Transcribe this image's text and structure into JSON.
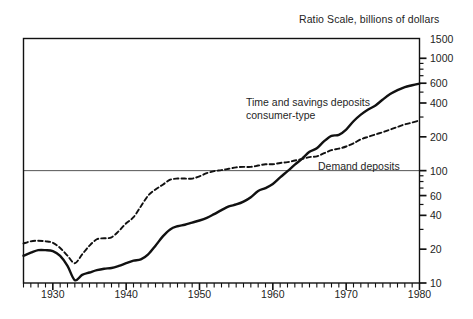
{
  "chart_data": {
    "type": "line",
    "title": "Ratio Scale, billions of dollars",
    "xlabel": "",
    "ylabel": "",
    "scale": "log",
    "grid": true,
    "gridlines_y": [
      100
    ],
    "legend_position": "inline-annotation",
    "xlim": [
      1926,
      1980
    ],
    "ylim": [
      10,
      1500
    ],
    "ytick_labels": [
      "1500",
      "1000",
      "600",
      "400",
      "200",
      "100",
      "60",
      "40",
      "20",
      "10"
    ],
    "ytick_values": [
      1500,
      1000,
      600,
      400,
      200,
      100,
      60,
      40,
      20,
      10
    ],
    "xtick_labels": [
      "1930",
      "1940",
      "1950",
      "1960",
      "1970",
      "1980"
    ],
    "xtick_values": [
      1930,
      1940,
      1950,
      1960,
      1970,
      1980
    ],
    "x": [
      1926,
      1927,
      1928,
      1929,
      1930,
      1931,
      1932,
      1933,
      1934,
      1935,
      1936,
      1937,
      1938,
      1939,
      1940,
      1941,
      1942,
      1943,
      1944,
      1945,
      1946,
      1947,
      1948,
      1949,
      1950,
      1951,
      1952,
      1953,
      1954,
      1955,
      1956,
      1957,
      1958,
      1959,
      1960,
      1961,
      1962,
      1963,
      1964,
      1965,
      1966,
      1967,
      1968,
      1969,
      1970,
      1971,
      1972,
      1973,
      1974,
      1975,
      1976,
      1977,
      1978,
      1979,
      1980
    ],
    "series": [
      {
        "name": "Time and savings deposits consumer-type",
        "style": "solid",
        "color": "#111111",
        "values": [
          17.5,
          18.6,
          19.6,
          19.6,
          19.2,
          17.4,
          14.2,
          10.6,
          11.8,
          12.4,
          13.0,
          13.4,
          13.6,
          14.2,
          15.0,
          15.8,
          16.2,
          18.0,
          21.5,
          26.0,
          30.0,
          32.0,
          33.0,
          34.5,
          36.0,
          38.0,
          41.0,
          44.5,
          48.0,
          50.0,
          53.0,
          58.0,
          66.0,
          70.0,
          76.0,
          87.0,
          99.0,
          113.0,
          128.0,
          147.0,
          158.0,
          183.0,
          204.0,
          208.0,
          232.0,
          275.0,
          315.0,
          350.0,
          380.0,
          430.0,
          480.0,
          520.0,
          555.0,
          575.0,
          595.0
        ]
      },
      {
        "name": "Demand deposits",
        "style": "dashed",
        "color": "#111111",
        "values": [
          22.5,
          23.5,
          23.8,
          23.5,
          22.8,
          20.5,
          17.5,
          15.0,
          18.0,
          21.5,
          24.5,
          25.0,
          25.5,
          29.0,
          34.0,
          38.5,
          48.0,
          60.0,
          68.0,
          75.0,
          83.0,
          85.0,
          85.0,
          85.0,
          89.0,
          95.0,
          99.0,
          101.0,
          104.0,
          107.0,
          108.0,
          108.0,
          111.0,
          114.0,
          114.0,
          117.0,
          119.0,
          123.0,
          127.0,
          132.0,
          134.0,
          143.0,
          152.0,
          157.0,
          164.0,
          175.0,
          190.0,
          200.0,
          210.0,
          220.0,
          232.0,
          245.0,
          258.0,
          268.0,
          280.0
        ]
      }
    ],
    "annotations": [
      {
        "name": "time-savings-label",
        "line1": "Time and savings deposits",
        "line2": "consumer-type"
      },
      {
        "name": "demand-deposits-label",
        "line1": "Demand deposits",
        "line2": ""
      }
    ]
  },
  "colors": {
    "axis": "#111111",
    "grid": "#555555",
    "background": "#ffffff",
    "text": "#232323"
  }
}
